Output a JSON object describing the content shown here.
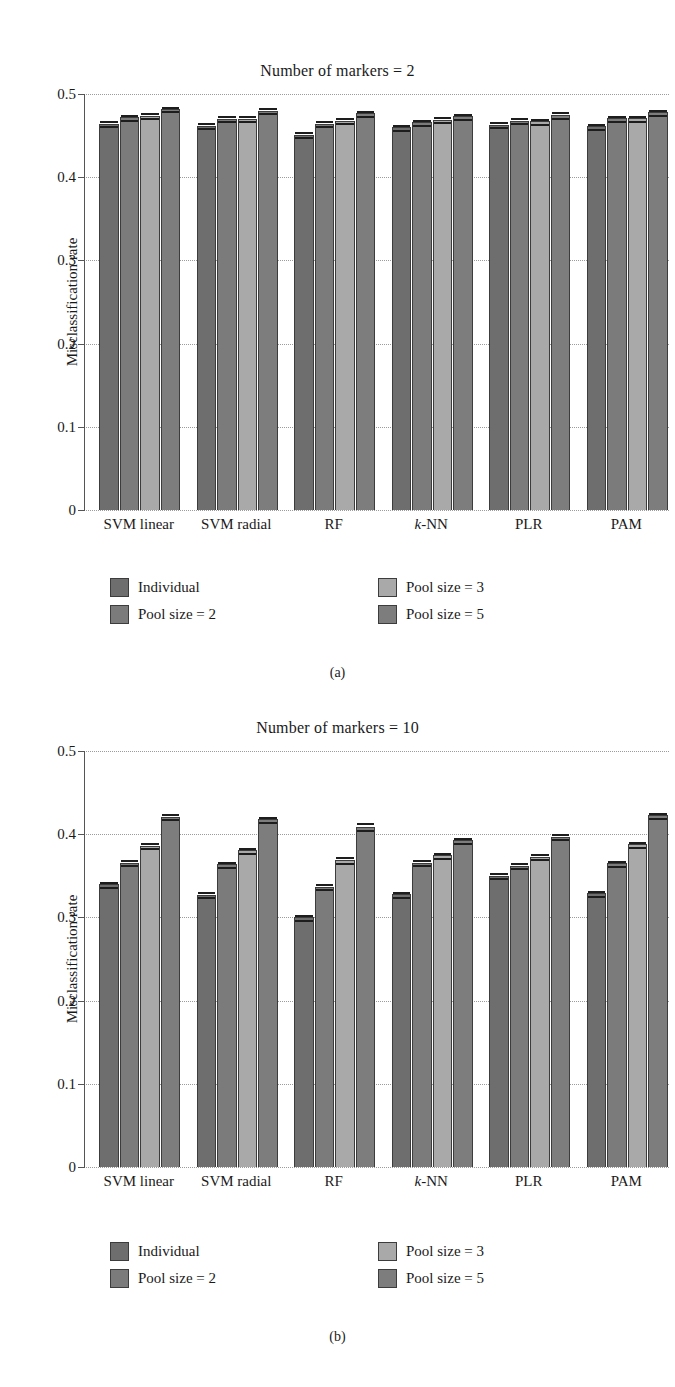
{
  "figure": {
    "ylabel": "Misclassification rate",
    "ytick_labels": [
      "0",
      "0.1",
      "0.2",
      "0.3",
      "0.4",
      "0.5"
    ],
    "categories": [
      "SVM linear",
      "SVM radial",
      "RF",
      "k-NN",
      "PLR",
      "PAM"
    ],
    "series_names": [
      "Individual",
      "Pool size = 2",
      "Pool size = 3",
      "Pool size = 5"
    ],
    "colors": {
      "individual": "#6e6e6e",
      "pool2": "#7b7b7b",
      "pool3": "#a9a9a9",
      "pool5": "#7d7d7d",
      "bar_edge": "#3c3c3c",
      "axis": "#555555",
      "grid": "#8a8a8a"
    },
    "captions": {
      "panel_a": "(a)",
      "panel_b": "(b)"
    },
    "legend": {
      "items": [
        {
          "label": "Individual",
          "color_key": "individual"
        },
        {
          "label": "Pool size = 2",
          "color_key": "pool2"
        },
        {
          "label": "Pool size = 3",
          "color_key": "pool3"
        },
        {
          "label": "Pool size = 5",
          "color_key": "pool5"
        }
      ]
    }
  },
  "chart_data": [
    {
      "type": "bar",
      "panel": "(a)",
      "title": "Number of markers = 2",
      "xlabel": "",
      "ylabel": "Misclassification rate",
      "ylim": [
        0,
        0.5
      ],
      "yticks": [
        0,
        0.1,
        0.2,
        0.3,
        0.4,
        0.5
      ],
      "grid": true,
      "legend_position": "below",
      "categories": [
        "SVM linear",
        "SVM radial",
        "RF",
        "k-NN",
        "PLR",
        "PAM"
      ],
      "series": [
        {
          "name": "Individual",
          "values": [
            0.464,
            0.462,
            0.451,
            0.46,
            0.463,
            0.461
          ],
          "errors": [
            0.003,
            0.003,
            0.003,
            0.003,
            0.003,
            0.003
          ]
        },
        {
          "name": "Pool size = 2",
          "values": [
            0.472,
            0.47,
            0.464,
            0.466,
            0.468,
            0.471
          ],
          "errors": [
            0.003,
            0.003,
            0.003,
            0.003,
            0.003,
            0.003
          ]
        },
        {
          "name": "Pool size = 3",
          "values": [
            0.474,
            0.47,
            0.468,
            0.469,
            0.467,
            0.471
          ],
          "errors": [
            0.003,
            0.003,
            0.003,
            0.003,
            0.003,
            0.003
          ]
        },
        {
          "name": "Pool size = 5",
          "values": [
            0.482,
            0.48,
            0.477,
            0.473,
            0.475,
            0.478
          ],
          "errors": [
            0.003,
            0.003,
            0.003,
            0.003,
            0.004,
            0.003
          ]
        }
      ]
    },
    {
      "type": "bar",
      "panel": "(b)",
      "title": "Number of markers = 10",
      "xlabel": "",
      "ylabel": "Misclassification rate",
      "ylim": [
        0,
        0.5
      ],
      "yticks": [
        0,
        0.1,
        0.2,
        0.3,
        0.4,
        0.5
      ],
      "grid": true,
      "legend_position": "below",
      "categories": [
        "SVM linear",
        "SVM radial",
        "RF",
        "k-NN",
        "PLR",
        "PAM"
      ],
      "series": [
        {
          "name": "Individual",
          "values": [
            0.34,
            0.327,
            0.3,
            0.328,
            0.35,
            0.329
          ],
          "errors": [
            0.003,
            0.003,
            0.003,
            0.003,
            0.003,
            0.003
          ]
        },
        {
          "name": "Pool size = 2",
          "values": [
            0.366,
            0.364,
            0.337,
            0.366,
            0.362,
            0.365
          ],
          "errors": [
            0.003,
            0.003,
            0.003,
            0.003,
            0.003,
            0.003
          ]
        },
        {
          "name": "Pool size = 3",
          "values": [
            0.386,
            0.381,
            0.369,
            0.375,
            0.373,
            0.388
          ],
          "errors": [
            0.003,
            0.003,
            0.004,
            0.003,
            0.003,
            0.003
          ]
        },
        {
          "name": "Pool size = 5",
          "values": [
            0.421,
            0.418,
            0.409,
            0.393,
            0.397,
            0.423
          ],
          "errors": [
            0.003,
            0.003,
            0.004,
            0.003,
            0.003,
            0.003
          ]
        }
      ]
    }
  ]
}
